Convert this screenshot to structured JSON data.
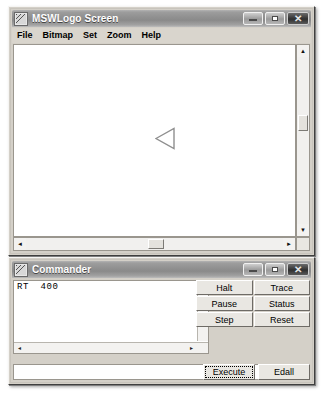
{
  "app": {
    "name": "MSWLogo"
  },
  "main_window": {
    "title": "MSWLogo Screen",
    "icon": "mswlogo-app-icon",
    "controls": {
      "minimize": "minimize-icon",
      "maximize": "maximize-icon",
      "close": "close-icon",
      "close_glyph": "✕"
    },
    "menu": [
      {
        "label": "File"
      },
      {
        "label": "Bitmap"
      },
      {
        "label": "Set"
      },
      {
        "label": "Zoom"
      },
      {
        "label": "Help"
      }
    ],
    "canvas": {
      "turtle": {
        "name": "turtle-cursor",
        "heading_description": "pointing-left",
        "x": 150,
        "y": 122,
        "width": 19,
        "height": 21
      }
    },
    "scrollbars": {
      "vertical": {
        "up_glyph": "▲",
        "down_glyph": "▼",
        "thumb_top_pct": 36,
        "thumb_height_px": 16
      },
      "horizontal": {
        "left_glyph": "◄",
        "right_glyph": "►",
        "thumb_left_pct": 48,
        "thumb_width_px": 16
      }
    }
  },
  "commander_window": {
    "title": "Commander",
    "icon": "mswlogo-app-icon",
    "controls": {
      "minimize": "minimize-icon",
      "maximize": "maximize-icon",
      "close": "close-icon",
      "close_glyph": "✕"
    },
    "history": {
      "text": "RT  400",
      "scroll_up_glyph": "▲",
      "scroll_left_glyph": "◄",
      "scroll_right_glyph": "►"
    },
    "input": {
      "value": "",
      "placeholder": ""
    },
    "buttons": [
      {
        "label": "Halt"
      },
      {
        "label": "Trace"
      },
      {
        "label": "Pause"
      },
      {
        "label": "Status"
      },
      {
        "label": "Step"
      },
      {
        "label": "Reset"
      }
    ],
    "bottom_buttons": [
      {
        "label": "Execute"
      },
      {
        "label": "Edall"
      }
    ]
  },
  "colors": {
    "window_face": "#d4d0c8",
    "titlebar_gradient_light": "#b3b3b3",
    "titlebar_gradient_dark": "#8a8a8a",
    "titlebar_text": "#ffffff",
    "canvas_background": "#ffffff",
    "turtle_outline": "#8a8a8a",
    "close_button": "#2f2f2f"
  }
}
